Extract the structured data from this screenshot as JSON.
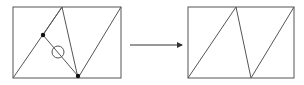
{
  "diagram": {
    "colors": {
      "stroke": "#555555",
      "dot": "#111111",
      "background": "#ffffff"
    },
    "left_figure": {
      "rect": {
        "x": 13,
        "y": 7,
        "w": 108,
        "h": 71
      },
      "lines": [
        {
          "x1": 13,
          "y1": 78,
          "x2": 62,
          "y2": 7
        },
        {
          "x1": 62,
          "y1": 7,
          "x2": 43,
          "y2": 35
        },
        {
          "x1": 62,
          "y1": 7,
          "x2": 78,
          "y2": 78
        },
        {
          "x1": 43,
          "y1": 35,
          "x2": 78,
          "y2": 76
        },
        {
          "x1": 78,
          "y1": 78,
          "x2": 121,
          "y2": 7
        }
      ],
      "dots": [
        {
          "cx": 43,
          "cy": 35,
          "r": 2.2
        },
        {
          "cx": 78,
          "cy": 76,
          "r": 2.2
        }
      ],
      "circle": {
        "cx": 58,
        "cy": 52,
        "r": 6
      }
    },
    "arrow": {
      "x1": 130,
      "y1": 45,
      "x2": 182,
      "y2": 45
    },
    "right_figure": {
      "rect": {
        "x": 188,
        "y": 7,
        "w": 106,
        "h": 71
      },
      "lines": [
        {
          "x1": 188,
          "y1": 78,
          "x2": 236,
          "y2": 7
        },
        {
          "x1": 236,
          "y1": 7,
          "x2": 251,
          "y2": 78
        },
        {
          "x1": 251,
          "y1": 78,
          "x2": 294,
          "y2": 7
        }
      ]
    }
  }
}
